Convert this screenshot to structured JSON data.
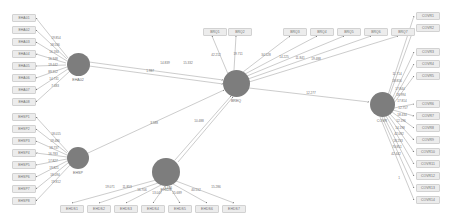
{
  "diagram": {
    "type": "path-diagram",
    "colors": {
      "node_fill": "#7d7d7d",
      "box_fill": "#ececec",
      "box_border": "#d2d2d2",
      "edge": "#8d8d8d",
      "background": "#ffffff",
      "text": "#6d6d6d"
    }
  },
  "latents": [
    {
      "id": "L1",
      "label": "EHA02",
      "cx": 78,
      "cy": 64,
      "r": 11.5
    },
    {
      "id": "L2",
      "label": "EHSP",
      "cx": 78,
      "cy": 158,
      "r": 11.0
    },
    {
      "id": "L3",
      "label": "BREQ",
      "cx": 236,
      "cy": 83,
      "r": 13.5
    },
    {
      "id": "L4",
      "label": "EHIDS",
      "cx": 166,
      "cy": 172,
      "r": 14.0
    },
    {
      "id": "L5",
      "label": "COVR",
      "cx": 382,
      "cy": 104,
      "r": 12.5
    }
  ],
  "boxes_left_top": [
    {
      "label": "EHA01",
      "x": 12,
      "y": 14
    },
    {
      "label": "EHA02",
      "x": 12,
      "y": 26
    },
    {
      "label": "EHA03",
      "x": 12,
      "y": 38
    },
    {
      "label": "EHA04",
      "x": 12,
      "y": 50
    },
    {
      "label": "EHA05",
      "x": 12,
      "y": 62
    },
    {
      "label": "EHA06",
      "x": 12,
      "y": 74
    },
    {
      "label": "EHA07",
      "x": 12,
      "y": 86
    },
    {
      "label": "EHA08",
      "x": 12,
      "y": 98
    }
  ],
  "boxes_left_bottom": [
    {
      "label": "EHSP1",
      "x": 12,
      "y": 113
    },
    {
      "label": "EHSP2",
      "x": 12,
      "y": 125
    },
    {
      "label": "EHSP3",
      "x": 12,
      "y": 137
    },
    {
      "label": "EHSP4",
      "x": 12,
      "y": 149
    },
    {
      "label": "EHSP5",
      "x": 12,
      "y": 161
    },
    {
      "label": "EHSP6",
      "x": 12,
      "y": 173
    },
    {
      "label": "EHSP7",
      "x": 12,
      "y": 185
    },
    {
      "label": "EHSP8",
      "x": 12,
      "y": 197
    }
  ],
  "boxes_top": [
    {
      "label": "BRQ1",
      "x": 203,
      "y": 28
    },
    {
      "label": "BRQ2",
      "x": 228,
      "y": 28
    },
    {
      "label": "BRQ3",
      "x": 283,
      "y": 28
    },
    {
      "label": "BRQ4",
      "x": 310,
      "y": 28
    },
    {
      "label": "BRQ5",
      "x": 337,
      "y": 28
    },
    {
      "label": "BRQ6",
      "x": 364,
      "y": 28
    },
    {
      "label": "BRQ7",
      "x": 391,
      "y": 28
    }
  ],
  "boxes_right_top": [
    {
      "label": "COVR1",
      "x": 416,
      "y": 12
    },
    {
      "label": "COVR2",
      "x": 416,
      "y": 24
    },
    {
      "label": "COVR3",
      "x": 416,
      "y": 48
    },
    {
      "label": "COVR4",
      "x": 416,
      "y": 60
    },
    {
      "label": "COVR5",
      "x": 416,
      "y": 72
    }
  ],
  "boxes_right_bottom": [
    {
      "label": "COVR6",
      "x": 416,
      "y": 100
    },
    {
      "label": "COVR7",
      "x": 416,
      "y": 112
    },
    {
      "label": "COVR8",
      "x": 416,
      "y": 124
    },
    {
      "label": "COVR9",
      "x": 416,
      "y": 136
    },
    {
      "label": "COVR10",
      "x": 416,
      "y": 148
    },
    {
      "label": "COVR11",
      "x": 416,
      "y": 160
    },
    {
      "label": "COVR12",
      "x": 416,
      "y": 172
    },
    {
      "label": "COVR13",
      "x": 416,
      "y": 184
    },
    {
      "label": "COVR14",
      "x": 416,
      "y": 196
    }
  ],
  "boxes_bottom": [
    {
      "label": "EHDS1",
      "x": 60,
      "y": 205
    },
    {
      "label": "EHDS2",
      "x": 87,
      "y": 205
    },
    {
      "label": "EHDS3",
      "x": 114,
      "y": 205
    },
    {
      "label": "EHDS4",
      "x": 141,
      "y": 205
    },
    {
      "label": "EHDS5",
      "x": 168,
      "y": 205
    },
    {
      "label": "EHDS6",
      "x": 195,
      "y": 205
    },
    {
      "label": "EHDS7",
      "x": 222,
      "y": 205
    }
  ],
  "edges": [
    {
      "from": "L1",
      "to": "b-lt-0",
      "x1": 68,
      "y1": 58,
      "x2": 36,
      "y2": 18,
      "label": "19.854",
      "lx": 56,
      "ly": 38
    },
    {
      "from": "L1",
      "to": "b-lt-1",
      "x1": 67,
      "y1": 59,
      "x2": 36,
      "y2": 30,
      "label": "18.536",
      "lx": 55,
      "ly": 45
    },
    {
      "from": "L1",
      "to": "b-lt-2",
      "x1": 67,
      "y1": 61,
      "x2": 36,
      "y2": 42,
      "label": "16.184",
      "lx": 54,
      "ly": 52
    },
    {
      "from": "L1",
      "to": "b-lt-3",
      "x1": 66,
      "y1": 63,
      "x2": 36,
      "y2": 54,
      "label": "16.348",
      "lx": 53,
      "ly": 59
    },
    {
      "from": "L1",
      "to": "b-lt-4",
      "x1": 66,
      "y1": 65,
      "x2": 36,
      "y2": 66,
      "label": "19.442",
      "lx": 53,
      "ly": 65
    },
    {
      "from": "L1",
      "to": "b-lt-5",
      "x1": 67,
      "y1": 67,
      "x2": 36,
      "y2": 78,
      "label": "89.312",
      "lx": 53,
      "ly": 72
    },
    {
      "from": "L1",
      "to": "b-lt-6",
      "x1": 68,
      "y1": 69,
      "x2": 36,
      "y2": 90,
      "label": "14.731",
      "lx": 54,
      "ly": 79
    },
    {
      "from": "L1",
      "to": "b-lt-7",
      "x1": 70,
      "y1": 71,
      "x2": 36,
      "y2": 102,
      "label": "7.483",
      "lx": 55,
      "ly": 86
    },
    {
      "from": "L2",
      "to": "b-lb-0",
      "x1": 68,
      "y1": 152,
      "x2": 36,
      "y2": 117,
      "label": "18.015",
      "lx": 56,
      "ly": 134
    },
    {
      "from": "L2",
      "to": "b-lb-1",
      "x1": 67,
      "y1": 153,
      "x2": 36,
      "y2": 129,
      "label": "19.486",
      "lx": 55,
      "ly": 141
    },
    {
      "from": "L2",
      "to": "b-lb-2",
      "x1": 67,
      "y1": 155,
      "x2": 36,
      "y2": 141,
      "label": "18.737",
      "lx": 54,
      "ly": 148
    },
    {
      "from": "L2",
      "to": "b-lb-3",
      "x1": 67,
      "y1": 157,
      "x2": 36,
      "y2": 153,
      "label": "16.783",
      "lx": 53,
      "ly": 154
    },
    {
      "from": "L2",
      "to": "b-lb-4",
      "x1": 67,
      "y1": 159,
      "x2": 36,
      "y2": 165,
      "label": "17.827",
      "lx": 53,
      "ly": 161
    },
    {
      "from": "L2",
      "to": "b-lb-5",
      "x1": 67,
      "y1": 161,
      "x2": 36,
      "y2": 177,
      "label": "19.821",
      "lx": 54,
      "ly": 168
    },
    {
      "from": "L2",
      "to": "b-lb-6",
      "x1": 68,
      "y1": 163,
      "x2": 36,
      "y2": 189,
      "label": "18.094",
      "lx": 55,
      "ly": 175
    },
    {
      "from": "L2",
      "to": "b-lb-7",
      "x1": 70,
      "y1": 165,
      "x2": 36,
      "y2": 201,
      "label": "19.812",
      "lx": 56,
      "ly": 182
    },
    {
      "from": "L3",
      "to": "b-t-0",
      "x1": 228,
      "y1": 74,
      "x2": 212,
      "y2": 36,
      "label": "42.212",
      "lx": 216,
      "ly": 55
    },
    {
      "from": "L3",
      "to": "b-t-1",
      "x1": 234,
      "y1": 70,
      "x2": 236,
      "y2": 36,
      "label": "19.711",
      "lx": 238,
      "ly": 54
    },
    {
      "from": "L3",
      "to": "b-t-2",
      "x1": 243,
      "y1": 72,
      "x2": 290,
      "y2": 36,
      "label": "34.528",
      "lx": 266,
      "ly": 55
    },
    {
      "from": "L3",
      "to": "b-t-3",
      "x1": 245,
      "y1": 74,
      "x2": 317,
      "y2": 36,
      "label": "14.225",
      "lx": 284,
      "ly": 57
    },
    {
      "from": "L3",
      "to": "b-t-4",
      "x1": 247,
      "y1": 76,
      "x2": 344,
      "y2": 36,
      "label": "11.841",
      "lx": 300,
      "ly": 58
    },
    {
      "from": "L3",
      "to": "b-t-5",
      "x1": 248,
      "y1": 79,
      "x2": 371,
      "y2": 36,
      "label": "19.488",
      "lx": 316,
      "ly": 59
    },
    {
      "from": "L3",
      "to": "b-t-6",
      "x1": 249,
      "y1": 82,
      "x2": 398,
      "y2": 36,
      "label": "",
      "lx": 0,
      "ly": 0
    },
    {
      "from": "L1",
      "to": "L3",
      "x1": 89,
      "y1": 62,
      "x2": 223,
      "y2": 80,
      "label": "14.839",
      "lx": 165,
      "ly": 63
    },
    {
      "from": "L1",
      "to": "L3",
      "x1": 89,
      "y1": 66,
      "x2": 223,
      "y2": 84,
      "label": "15.332",
      "lx": 188,
      "ly": 63
    },
    {
      "from": "L2",
      "to": "L3",
      "x1": 88,
      "y1": 153,
      "x2": 224,
      "y2": 90,
      "label": "1.987",
      "lx": 150,
      "ly": 71
    },
    {
      "from": "L4",
      "to": "L3",
      "x1": 175,
      "y1": 160,
      "x2": 231,
      "y2": 96,
      "label": "3.588",
      "lx": 154,
      "ly": 123
    },
    {
      "from": "L4",
      "to": "L3",
      "x1": 178,
      "y1": 162,
      "x2": 233,
      "y2": 97,
      "label": "10.488",
      "lx": 199,
      "ly": 121
    },
    {
      "from": "L3",
      "to": "L5",
      "x1": 249,
      "y1": 88,
      "x2": 369,
      "y2": 102,
      "label": "12.277",
      "lx": 311,
      "ly": 93
    },
    {
      "from": "L5",
      "to": "b-rt-0",
      "x1": 388,
      "y1": 95,
      "x2": 414,
      "y2": 16,
      "label": "11.714",
      "lx": 397,
      "ly": 74
    },
    {
      "from": "L5",
      "to": "b-rt-1",
      "x1": 389,
      "y1": 97,
      "x2": 414,
      "y2": 28,
      "label": "18.816",
      "lx": 397,
      "ly": 81
    },
    {
      "from": "L5",
      "to": "b-rt-2",
      "x1": 392,
      "y1": 99,
      "x2": 414,
      "y2": 52,
      "label": "17.844",
      "lx": 400,
      "ly": 89
    },
    {
      "from": "L5",
      "to": "b-rt-3",
      "x1": 393,
      "y1": 101,
      "x2": 414,
      "y2": 64,
      "label": "18.994",
      "lx": 401,
      "ly": 95
    },
    {
      "from": "L5",
      "to": "b-rt-4",
      "x1": 394,
      "y1": 103,
      "x2": 414,
      "y2": 76,
      "label": "17.814",
      "lx": 402,
      "ly": 101
    },
    {
      "from": "L5",
      "to": "b-rb-0",
      "x1": 394,
      "y1": 108,
      "x2": 414,
      "y2": 104,
      "label": "12.757",
      "lx": 403,
      "ly": 108
    },
    {
      "from": "L5",
      "to": "b-rb-1",
      "x1": 393,
      "y1": 110,
      "x2": 414,
      "y2": 116,
      "label": "18.434",
      "lx": 402,
      "ly": 115
    },
    {
      "from": "L5",
      "to": "b-rb-2",
      "x1": 392,
      "y1": 112,
      "x2": 414,
      "y2": 128,
      "label": "12.196",
      "lx": 401,
      "ly": 121
    },
    {
      "from": "L5",
      "to": "b-rb-3",
      "x1": 390,
      "y1": 114,
      "x2": 414,
      "y2": 140,
      "label": "14.198",
      "lx": 400,
      "ly": 128
    },
    {
      "from": "L5",
      "to": "b-rb-4",
      "x1": 388,
      "y1": 115,
      "x2": 414,
      "y2": 152,
      "label": "42.092",
      "lx": 399,
      "ly": 134
    },
    {
      "from": "L5",
      "to": "b-rb-5",
      "x1": 386,
      "y1": 116,
      "x2": 414,
      "y2": 164,
      "label": "18.233",
      "lx": 398,
      "ly": 141
    },
    {
      "from": "L5",
      "to": "b-rb-6",
      "x1": 384,
      "y1": 117,
      "x2": 414,
      "y2": 176,
      "label": "70.851",
      "lx": 397,
      "ly": 147
    },
    {
      "from": "L5",
      "to": "b-rb-7",
      "x1": 382,
      "y1": 117,
      "x2": 414,
      "y2": 188,
      "label": "42.442",
      "lx": 396,
      "ly": 154
    },
    {
      "from": "L5",
      "to": "b-rb-8",
      "x1": 380,
      "y1": 117,
      "x2": 414,
      "y2": 200,
      "label": "1",
      "lx": 399,
      "ly": 178
    },
    {
      "from": "L4",
      "to": "b-b-0",
      "x1": 156,
      "y1": 180,
      "x2": 72,
      "y2": 203,
      "label": "19.071",
      "lx": 110,
      "ly": 187
    },
    {
      "from": "L4",
      "to": "b-b-1",
      "x1": 158,
      "y1": 183,
      "x2": 99,
      "y2": 203,
      "label": "11.853",
      "lx": 127,
      "ly": 187
    },
    {
      "from": "L4",
      "to": "b-b-2",
      "x1": 161,
      "y1": 185,
      "x2": 126,
      "y2": 203,
      "label": "16.706",
      "lx": 142,
      "ly": 190
    },
    {
      "from": "L4",
      "to": "b-b-3",
      "x1": 165,
      "y1": 186,
      "x2": 153,
      "y2": 203,
      "label": "13.047",
      "lx": 157,
      "ly": 193
    },
    {
      "from": "L4",
      "to": "b-b-4",
      "x1": 169,
      "y1": 186,
      "x2": 180,
      "y2": 203,
      "label": "15.689",
      "lx": 177,
      "ly": 193
    },
    {
      "from": "L4",
      "to": "b-b-5",
      "x1": 173,
      "y1": 184,
      "x2": 207,
      "y2": 203,
      "label": "40.512",
      "lx": 196,
      "ly": 190
    },
    {
      "from": "L4",
      "to": "b-b-6",
      "x1": 176,
      "y1": 181,
      "x2": 234,
      "y2": 203,
      "label": "15.286",
      "lx": 216,
      "ly": 187
    },
    {
      "from": "L4",
      "to": "b-b-top",
      "x1": 167,
      "y1": 158,
      "x2": 167,
      "y2": 186,
      "label": "3.446",
      "lx": 168,
      "ly": 188
    }
  ]
}
